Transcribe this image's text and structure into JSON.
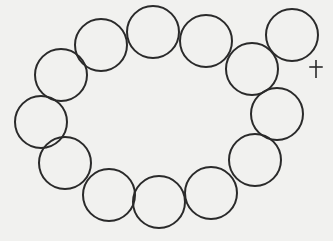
{
  "diagram": {
    "background": "#f1f1ef",
    "stroke_color": "#2a2a2a",
    "stroke_width": 2,
    "radius": 26,
    "circles": [
      {
        "id": "c1",
        "cx": 101,
        "cy": 45
      },
      {
        "id": "c2",
        "cx": 153,
        "cy": 32
      },
      {
        "id": "c3",
        "cx": 206,
        "cy": 41
      },
      {
        "id": "c4",
        "cx": 252,
        "cy": 69
      },
      {
        "id": "c5",
        "cx": 277,
        "cy": 114
      },
      {
        "id": "c6",
        "cx": 255,
        "cy": 160
      },
      {
        "id": "c7",
        "cx": 211,
        "cy": 193
      },
      {
        "id": "c8",
        "cx": 159,
        "cy": 202
      },
      {
        "id": "c9",
        "cx": 109,
        "cy": 195
      },
      {
        "id": "c10",
        "cx": 65,
        "cy": 163
      },
      {
        "id": "c11",
        "cx": 41,
        "cy": 122
      },
      {
        "id": "c12",
        "cx": 61,
        "cy": 75
      }
    ],
    "displaced_circle": {
      "id": "c13",
      "cx": 292,
      "cy": 35
    },
    "marker": {
      "symbol": "+",
      "x": 316,
      "y": 69,
      "size": 18
    }
  }
}
